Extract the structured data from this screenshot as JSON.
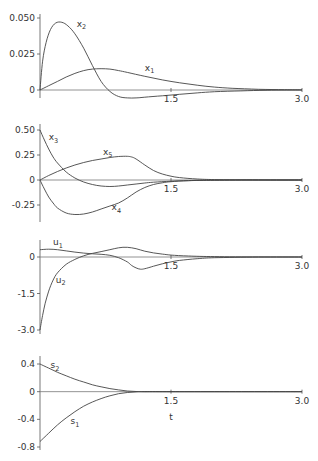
{
  "chart_data": [
    {
      "type": "line",
      "title": "",
      "xlabel": "",
      "ylabel": "",
      "xlim": [
        0,
        3.0
      ],
      "ylim": [
        -0.01,
        0.05
      ],
      "xticks": [
        {
          "v": 1.5,
          "label": "1.5"
        },
        {
          "v": 3.0,
          "label": "3.0"
        }
      ],
      "yticks": [
        {
          "v": 0.05,
          "label": "0.050"
        },
        {
          "v": 0.025,
          "label": "0.025"
        },
        {
          "v": 0,
          "label": "0"
        }
      ],
      "series": [
        {
          "name": "x",
          "sub": "1",
          "x": [
            0,
            0.1,
            0.2,
            0.3,
            0.4,
            0.5,
            0.6,
            0.7,
            0.8,
            0.9,
            1.0,
            1.2,
            1.4,
            1.6,
            1.8,
            2.0,
            2.2,
            2.5,
            2.8,
            3.0
          ],
          "y": [
            0,
            0.003,
            0.006,
            0.009,
            0.0115,
            0.0135,
            0.0145,
            0.0148,
            0.0145,
            0.0135,
            0.0122,
            0.0095,
            0.007,
            0.005,
            0.0033,
            0.002,
            0.0012,
            0.0005,
            0.0002,
            0.0001
          ],
          "label_at": [
            1.2,
            0.0135
          ]
        },
        {
          "name": "x",
          "sub": "2",
          "x": [
            0,
            0.03,
            0.07,
            0.12,
            0.18,
            0.25,
            0.32,
            0.4,
            0.5,
            0.6,
            0.7,
            0.8,
            0.9,
            1.0,
            1.1,
            1.2,
            1.4,
            1.6,
            1.8,
            2.0,
            2.3,
            2.6,
            3.0
          ],
          "y": [
            0,
            0.02,
            0.033,
            0.042,
            0.0465,
            0.047,
            0.0445,
            0.039,
            0.029,
            0.017,
            0.006,
            -0.001,
            -0.0045,
            -0.0055,
            -0.0055,
            -0.005,
            -0.004,
            -0.003,
            -0.002,
            -0.0012,
            -0.0006,
            -0.0002,
            0
          ],
          "label_at": [
            0.42,
            0.044
          ]
        }
      ]
    },
    {
      "type": "line",
      "title": "",
      "xlabel": "",
      "ylabel": "",
      "xlim": [
        0,
        3.0
      ],
      "ylim": [
        -0.35,
        0.5
      ],
      "xticks": [
        {
          "v": 1.5,
          "label": "1.5"
        },
        {
          "v": 3.0,
          "label": "3.0"
        }
      ],
      "yticks": [
        {
          "v": 0.5,
          "label": "0.50"
        },
        {
          "v": 0.25,
          "label": "0.25"
        },
        {
          "v": 0,
          "label": "0"
        },
        {
          "v": -0.25,
          "label": "-0.25"
        }
      ],
      "series": [
        {
          "name": "x",
          "sub": "3",
          "x": [
            0,
            0.05,
            0.1,
            0.15,
            0.2,
            0.3,
            0.4,
            0.5,
            0.6,
            0.7,
            0.8,
            0.9,
            1.0,
            1.1,
            1.2,
            1.3,
            1.5,
            1.7,
            2.0,
            2.5,
            3.0
          ],
          "y": [
            0.5,
            0.4,
            0.31,
            0.23,
            0.17,
            0.08,
            0.02,
            -0.02,
            -0.045,
            -0.06,
            -0.065,
            -0.06,
            -0.05,
            -0.04,
            -0.03,
            -0.022,
            -0.012,
            -0.006,
            -0.002,
            0,
            0
          ],
          "label_at": [
            0.1,
            0.4
          ]
        },
        {
          "name": "x",
          "sub": "4",
          "x": [
            0,
            0.05,
            0.1,
            0.15,
            0.2,
            0.3,
            0.4,
            0.5,
            0.6,
            0.7,
            0.8,
            0.9,
            1.0,
            1.1,
            1.2,
            1.3,
            1.4,
            1.5,
            1.7,
            2.0,
            2.5,
            3.0
          ],
          "y": [
            0,
            -0.09,
            -0.17,
            -0.23,
            -0.28,
            -0.33,
            -0.345,
            -0.34,
            -0.32,
            -0.29,
            -0.26,
            -0.23,
            -0.18,
            -0.12,
            -0.075,
            -0.045,
            -0.028,
            -0.017,
            -0.007,
            -0.002,
            0,
            0
          ],
          "label_at": [
            0.82,
            -0.3
          ]
        },
        {
          "name": "x",
          "sub": "5",
          "x": [
            0,
            0.1,
            0.2,
            0.3,
            0.4,
            0.5,
            0.6,
            0.7,
            0.8,
            0.9,
            1.0,
            1.05,
            1.1,
            1.2,
            1.3,
            1.4,
            1.5,
            1.6,
            1.8,
            2.0,
            2.5,
            3.0
          ],
          "y": [
            0,
            0.045,
            0.085,
            0.12,
            0.15,
            0.175,
            0.195,
            0.21,
            0.225,
            0.235,
            0.237,
            0.23,
            0.21,
            0.15,
            0.095,
            0.06,
            0.038,
            0.024,
            0.01,
            0.004,
            0.001,
            0
          ],
          "label_at": [
            0.72,
            0.255
          ]
        }
      ]
    },
    {
      "type": "line",
      "title": "",
      "xlabel": "",
      "ylabel": "",
      "xlim": [
        0,
        3.0
      ],
      "ylim": [
        -3.0,
        0.6
      ],
      "xticks": [
        {
          "v": 1.5,
          "label": "1.5"
        },
        {
          "v": 3.0,
          "label": "3.0"
        }
      ],
      "yticks": [
        {
          "v": 0,
          "label": "0"
        },
        {
          "v": -1.5,
          "label": "-1.5"
        },
        {
          "v": -3.0,
          "label": "-3.0"
        }
      ],
      "series": [
        {
          "name": "u",
          "sub": "1",
          "x": [
            0,
            0.1,
            0.2,
            0.3,
            0.4,
            0.5,
            0.6,
            0.7,
            0.8,
            0.9,
            1.0,
            1.05,
            1.1,
            1.15,
            1.2,
            1.3,
            1.4,
            1.5,
            1.6,
            1.8,
            2.0,
            2.5,
            3.0
          ],
          "y": [
            0.3,
            0.32,
            0.3,
            0.25,
            0.2,
            0.16,
            0.13,
            0.11,
            0.07,
            -0.03,
            -0.2,
            -0.35,
            -0.45,
            -0.5,
            -0.48,
            -0.38,
            -0.28,
            -0.2,
            -0.14,
            -0.07,
            -0.03,
            -0.005,
            0
          ],
          "label_at": [
            0.15,
            0.48
          ]
        },
        {
          "name": "u",
          "sub": "2",
          "x": [
            0,
            0.03,
            0.06,
            0.1,
            0.15,
            0.2,
            0.3,
            0.4,
            0.5,
            0.6,
            0.7,
            0.8,
            0.9,
            1.0,
            1.1,
            1.2,
            1.3,
            1.4,
            1.5,
            1.7,
            2.0,
            2.5,
            3.0
          ],
          "y": [
            -3.0,
            -2.4,
            -1.9,
            -1.4,
            -0.95,
            -0.65,
            -0.3,
            -0.1,
            0.05,
            0.15,
            0.22,
            0.3,
            0.38,
            0.4,
            0.34,
            0.24,
            0.17,
            0.12,
            0.08,
            0.04,
            0.015,
            0.003,
            0
          ],
          "label_at": [
            0.18,
            -1.05
          ]
        }
      ]
    },
    {
      "type": "line",
      "title": "",
      "xlabel": "t",
      "ylabel": "",
      "xlim": [
        0,
        3.0
      ],
      "ylim": [
        -0.8,
        0.45
      ],
      "xticks": [
        {
          "v": 1.5,
          "label": "1.5"
        },
        {
          "v": 3.0,
          "label": "3.0"
        }
      ],
      "yticks": [
        {
          "v": 0.4,
          "label": "0.4"
        },
        {
          "v": 0,
          "label": "0"
        },
        {
          "v": -0.4,
          "label": "-0.4"
        },
        {
          "v": -0.8,
          "label": "-0.8"
        }
      ],
      "series": [
        {
          "name": "s",
          "sub": "1",
          "x": [
            0,
            0.1,
            0.2,
            0.3,
            0.4,
            0.5,
            0.6,
            0.7,
            0.8,
            0.9,
            1.0,
            1.1,
            1.2,
            1.5,
            2.0,
            3.0
          ],
          "y": [
            -0.72,
            -0.6,
            -0.48,
            -0.38,
            -0.29,
            -0.21,
            -0.15,
            -0.1,
            -0.06,
            -0.03,
            -0.012,
            -0.003,
            0,
            0,
            0,
            0
          ],
          "label_at": [
            0.35,
            -0.47
          ]
        },
        {
          "name": "s",
          "sub": "2",
          "x": [
            0,
            0.1,
            0.2,
            0.3,
            0.4,
            0.5,
            0.6,
            0.7,
            0.8,
            0.9,
            1.0,
            1.1,
            1.2,
            1.5,
            2.0,
            3.0
          ],
          "y": [
            0.4,
            0.34,
            0.28,
            0.23,
            0.18,
            0.14,
            0.1,
            0.07,
            0.045,
            0.025,
            0.01,
            0.003,
            0,
            0,
            0,
            0
          ],
          "label_at": [
            0.12,
            0.34
          ]
        }
      ]
    }
  ]
}
